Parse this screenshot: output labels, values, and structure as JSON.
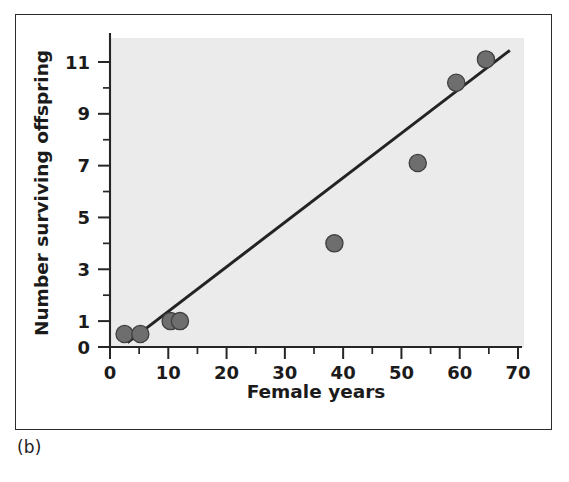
{
  "figure": {
    "panel_label": "(b)",
    "background_color": "#ffffff",
    "frame_color": "#2b2b2b"
  },
  "chart_data": {
    "type": "scatter",
    "title": "",
    "subtitle": "",
    "xlabel": "Female years",
    "ylabel": "Number surviving offspring",
    "xlim": [
      0,
      70
    ],
    "ylim": [
      0,
      12
    ],
    "grid": false,
    "legend": false,
    "legend_position": "none",
    "plot_background_color": "#ebebeb",
    "point_color": "#6e6e6e",
    "point_edge_color": "#3f3f3f",
    "line_color": "#232323",
    "x_ticks_major": [
      0,
      10,
      20,
      30,
      40,
      50,
      60,
      70
    ],
    "x_tick_labels": [
      "0",
      "10",
      "20",
      "30",
      "40",
      "50",
      "60",
      "70"
    ],
    "x_ticks_minor": [
      5,
      15,
      25,
      35,
      45,
      55,
      65
    ],
    "y_ticks_major": [
      0,
      1,
      3,
      5,
      7,
      9,
      11
    ],
    "y_tick_labels": [
      "0",
      "1",
      "3",
      "5",
      "7",
      "9",
      "11"
    ],
    "y_ticks_minor": [
      2,
      4,
      6,
      8,
      10
    ],
    "points": [
      {
        "x": 2.5,
        "y": 0.5
      },
      {
        "x": 5.2,
        "y": 0.5
      },
      {
        "x": 10.4,
        "y": 1.0
      },
      {
        "x": 12.0,
        "y": 1.0
      },
      {
        "x": 38.5,
        "y": 4.0
      },
      {
        "x": 52.8,
        "y": 7.1
      },
      {
        "x": 59.4,
        "y": 10.2
      },
      {
        "x": 64.5,
        "y": 11.1
      }
    ],
    "series": [
      {
        "name": "observations",
        "marker": "circle",
        "x": [
          2.5,
          5.2,
          10.4,
          12.0,
          38.5,
          52.8,
          59.4,
          64.5
        ],
        "values": [
          0.5,
          0.5,
          1.0,
          1.0,
          4.0,
          7.1,
          10.2,
          11.1
        ]
      }
    ],
    "trendline": {
      "name": "linear fit",
      "x_start": 3.0,
      "y_start": 0.17,
      "x_end": 68.6,
      "y_end": 11.45
    }
  }
}
